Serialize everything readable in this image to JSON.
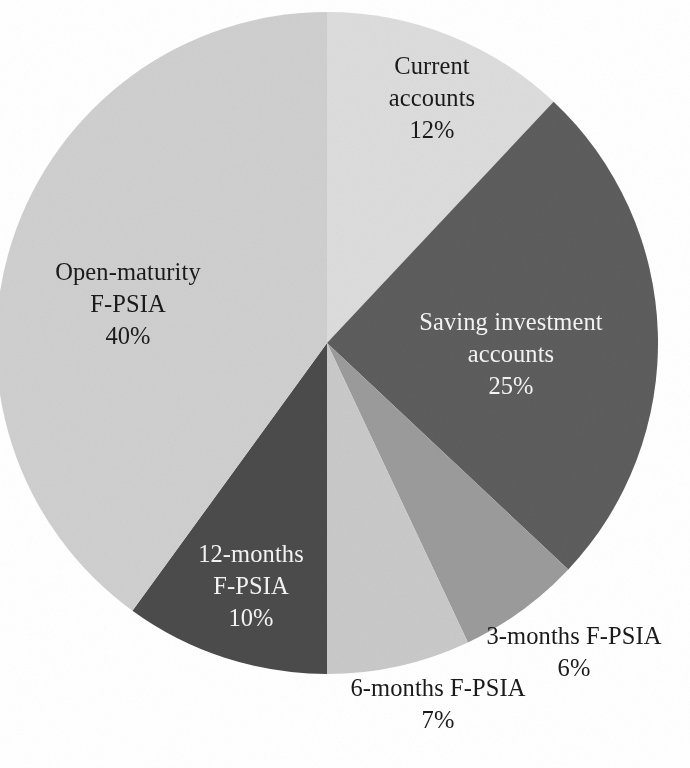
{
  "figure": {
    "background_color": "#ffffff",
    "text_color_dark": "#1a1a1a",
    "text_color_light": "#f2f2f2"
  },
  "chart_data": {
    "type": "pie",
    "title": "",
    "subtitle": "",
    "xlabel": "",
    "ylabel": "",
    "legend_position": "none",
    "grid": false,
    "start_angle_deg": 0,
    "direction": "clockwise",
    "value_unit": "%",
    "categories": [
      "Current accounts",
      "Saving investment accounts",
      "3-months F-PSIA",
      "6-months F-PSIA",
      "12-months F-PSIA",
      "Open-maturity F-PSIA"
    ],
    "values": [
      12,
      25,
      6,
      7,
      10,
      40
    ],
    "slices": [
      {
        "label": "Current accounts",
        "label_line1": "Current",
        "label_line2": "accounts",
        "value": 12,
        "value_text": "12%",
        "color": "#dcdcdc",
        "label_color": "#1a1a1a",
        "label_placement": "inside"
      },
      {
        "label": "Saving investment accounts",
        "label_line1": "Saving investment",
        "label_line2": "accounts",
        "value": 25,
        "value_text": "25%",
        "color": "#5d5d5d",
        "label_color": "#f2f2f2",
        "label_placement": "inside"
      },
      {
        "label": "3-months F-PSIA",
        "label_line1": "3-months F-PSIA",
        "label_line2": "",
        "value": 6,
        "value_text": "6%",
        "color": "#9b9b9b",
        "label_color": "#1a1a1a",
        "label_placement": "outside"
      },
      {
        "label": "6-months F-PSIA",
        "label_line1": "6-months F-PSIA",
        "label_line2": "",
        "value": 7,
        "value_text": "7%",
        "color": "#c9c9c9",
        "label_color": "#1a1a1a",
        "label_placement": "outside"
      },
      {
        "label": "12-months F-PSIA",
        "label_line1": "12-months",
        "label_line2": "F-PSIA",
        "value": 10,
        "value_text": "10%",
        "color": "#4b4b4b",
        "label_color": "#f2f2f2",
        "label_placement": "inside"
      },
      {
        "label": "Open-maturity F-PSIA",
        "label_line1": "Open-maturity",
        "label_line2": "F-PSIA",
        "value": 40,
        "value_text": "40%",
        "color": "#cfcfcf",
        "label_color": "#1a1a1a",
        "label_placement": "inside"
      }
    ]
  }
}
